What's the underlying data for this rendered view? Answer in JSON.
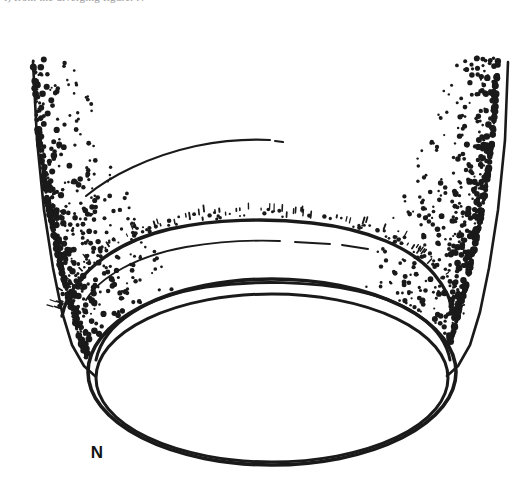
{
  "page": {
    "width": 531,
    "height": 491,
    "background_color": "#ffffff",
    "ink_color": "#1a1a1a",
    "medium": "pen-and-ink stipple line drawing"
  },
  "caption": {
    "clipped_top_text": "t) from the diverging figure. N"
  },
  "labels": [
    {
      "id": "N",
      "text": "N",
      "x": 97,
      "y": 458,
      "font_size": 17
    }
  ],
  "outlines": {
    "left_wall": {
      "name": "left-funnel-wall",
      "path": "M 33 62 L 37 140 L 44 210 L 53 268 L 62 312 L 72 345 L 84 366 L 95 376"
    },
    "right_wall": {
      "name": "right-funnel-wall",
      "path": "M 508 62 L 505 140 L 498 210 L 489 268 L 480 312 L 470 345 L 458 366 L 447 376"
    },
    "top_broken_arc": {
      "name": "upper-inner-arc",
      "segments": [
        "M 86 196 C 110 176 150 156 196 146 C 226 140 252 139 270 140",
        "M 275 141 L 283 142"
      ]
    },
    "rim_outer_arc": {
      "name": "bowl-outer-rim-arc",
      "path": "M 62 316 C 70 278 110 243 170 229 C 215 219 268 218 312 223 C 368 229 412 248 434 274 C 446 288 452 302 454 316"
    },
    "rim_inner_broken_arc": {
      "name": "bowl-inner-broken-arc",
      "segments": [
        "M 86 300 C 100 277 136 256 186 247 C 222 241 256 240 280 241",
        "M 295 242 L 330 244",
        "M 342 245 L 368 249"
      ]
    },
    "ellipse_outer": {
      "name": "main-rim-ellipse-outer",
      "cx": 272,
      "cy": 372,
      "rx": 184,
      "ry": 93
    },
    "ellipse_inner": {
      "name": "main-rim-ellipse-inner",
      "cx": 272,
      "cy": 378,
      "rx": 176,
      "ry": 84
    },
    "ellipse_mid_arc": {
      "name": "rim-upper-double-line",
      "path": "M 96 360 C 104 322 148 296 206 287 C 254 280 312 281 358 291 C 412 303 444 328 450 360"
    }
  },
  "stipple": {
    "description": "ink dot shading on both flanks, dense near walls, fading inward and upward",
    "dot_color": "#1a1a1a",
    "seed": 20240517,
    "left_field": {
      "name": "left-stipple-field",
      "count": 980,
      "x_min": 34,
      "x_max": 168,
      "y_min": 58,
      "y_max": 386,
      "edge_bias": 3.0
    },
    "right_field": {
      "name": "right-stipple-field",
      "count": 980,
      "x_min": 372,
      "x_max": 508,
      "y_min": 58,
      "y_max": 386,
      "edge_bias": 3.0
    },
    "rim_ticks": {
      "name": "rim-edge-ticks",
      "count": 150,
      "description": "short ticks and dots scattered along the outer rim arc"
    }
  },
  "chart_data": {
    "type": "scatter",
    "title": "",
    "xlabel": "",
    "ylabel": "",
    "note": "Stipple density field: ink-dot concentration as a function of distance from the funnel wall. Values are qualitative density levels read off the drawing.",
    "categories": [
      "at wall",
      "near wall",
      "mid flank",
      "inner flank",
      "open centre"
    ],
    "values": [
      100,
      72,
      38,
      14,
      0
    ],
    "ylim": [
      0,
      100
    ]
  }
}
